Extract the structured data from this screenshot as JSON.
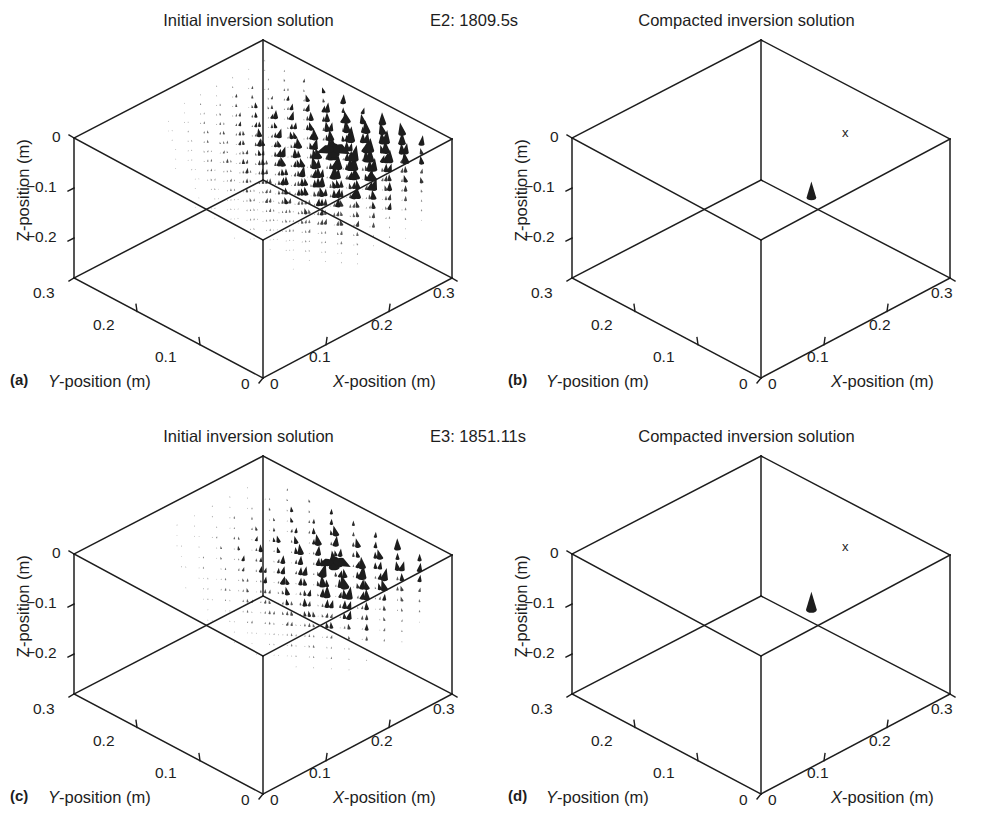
{
  "figure": {
    "background": "#ffffff",
    "ink": "#1d1d1d",
    "panel_count": 4
  },
  "panels": [
    {
      "key": "a",
      "letter": "(a)",
      "title": "Initial inversion solution",
      "run_label": "E2: 1809.5s",
      "field": "dense-vectors",
      "marker_x": null
    },
    {
      "key": "b",
      "letter": "(b)",
      "title": "Compacted inversion solution",
      "run_label": "",
      "field": "single-cone",
      "marker_x": "x"
    },
    {
      "key": "c",
      "letter": "(c)",
      "title": "Initial inversion solution",
      "run_label": "E3: 1851.11s",
      "field": "sparse-vectors",
      "marker_x": null
    },
    {
      "key": "d",
      "letter": "(d)",
      "title": "Compacted inversion solution",
      "run_label": "",
      "field": "single-cone",
      "marker_x": "x"
    }
  ],
  "axes": {
    "x_label": "X-position (m)",
    "y_label": "Y-position (m)",
    "z_label": "Z-position (m)",
    "x_ticks": [
      "0",
      "0.1",
      "0.2",
      "0.3"
    ],
    "y_ticks": [
      "0",
      "0.1",
      "0.2",
      "0.3"
    ],
    "z_ticks": [
      "0",
      "−0.1",
      "−0.2"
    ],
    "x_range": [
      0,
      0.3
    ],
    "y_range": [
      0,
      0.3
    ],
    "z_range": [
      -0.3,
      0
    ]
  },
  "chart_data": {
    "type": "scatter",
    "subtitle": "Four 3D box plots: initial vs compacted inversion for runs E2 and E3",
    "xlabel": "X-position (m)",
    "ylabel": "Y-position (m)",
    "zlabel": "Z-position (m)",
    "xlim": [
      0,
      0.3
    ],
    "ylim": [
      0,
      0.3
    ],
    "zlim": [
      -0.3,
      0
    ],
    "grid": false,
    "legend": null,
    "xtick_labels": [
      "0",
      "0.1",
      "0.2",
      "0.3"
    ],
    "ytick_labels": [
      "0",
      "0.1",
      "0.2",
      "0.3"
    ],
    "ztick_labels": [
      "0",
      "−0.1",
      "−0.2"
    ],
    "annotations": [
      {
        "panel": "a",
        "text": "Initial inversion solution",
        "position": "top-center"
      },
      {
        "panel": "a",
        "text": "E2: 1809.5s",
        "position": "top-right"
      },
      {
        "panel": "b",
        "text": "Compacted inversion solution",
        "position": "top-center"
      },
      {
        "panel": "b",
        "text": "x",
        "position": "interior-upper-right",
        "meaning": "true source location marker"
      },
      {
        "panel": "c",
        "text": "Initial inversion solution",
        "position": "top-center"
      },
      {
        "panel": "c",
        "text": "E3: 1851.11s",
        "position": "top-right"
      },
      {
        "panel": "d",
        "text": "Compacted inversion solution",
        "position": "top-center"
      },
      {
        "panel": "d",
        "text": "x",
        "position": "interior-upper-right",
        "meaning": "true source location marker"
      }
    ],
    "series": [
      {
        "name": "a: E2 initial inversion dipole field",
        "panel": "a",
        "glyph": "cone",
        "description": "Dense distributed set of small downward/upward cone glyphs filling the right half of the volume, largest magnitudes clustered near X 0.18-0.24, Y 0.05-0.15, Z -0.02 to -0.08",
        "point_count": 300,
        "max_magnitude": 1.0,
        "peak_location": {
          "x": 0.21,
          "y": 0.1,
          "z": -0.04
        }
      },
      {
        "name": "b: E2 compacted inversion dipole",
        "panel": "b",
        "glyph": "cone",
        "description": "Single compact upward cone",
        "point_count": 1,
        "max_magnitude": 1.0,
        "peak_location": {
          "x": 0.19,
          "y": 0.11,
          "z": -0.13
        }
      },
      {
        "name": "c: E3 initial inversion dipole field",
        "panel": "c",
        "glyph": "cone",
        "description": "Sparser distributed cone glyphs on the right half with a dark concentrated blob near the top",
        "point_count": 190,
        "max_magnitude": 1.0,
        "peak_location": {
          "x": 0.2,
          "y": 0.09,
          "z": -0.02
        }
      },
      {
        "name": "d: E3 compacted inversion dipole",
        "panel": "d",
        "glyph": "cone",
        "description": "Single compact upward cone",
        "point_count": 1,
        "max_magnitude": 1.0,
        "peak_location": {
          "x": 0.19,
          "y": 0.11,
          "z": -0.12
        }
      }
    ]
  }
}
